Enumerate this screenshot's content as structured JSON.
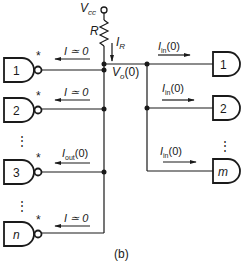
{
  "diagram": {
    "caption": "(b)",
    "supply": {
      "label": "V",
      "label_sub": "cc"
    },
    "resistor": {
      "label": "R"
    },
    "resistor_current": {
      "label": "I",
      "label_sub": "R"
    },
    "node_voltage": {
      "label": "V",
      "label_sub": "o",
      "label_suffix": "(0)"
    },
    "driver_gates": [
      {
        "id": "1",
        "star": "*",
        "current_label": "I ≃ 0"
      },
      {
        "id": "2",
        "star": "*",
        "current_label": "I ≃ 0"
      },
      {
        "id": "3",
        "star": "*",
        "current_label": "I",
        "current_sub": "out",
        "current_suffix": "(0)"
      },
      {
        "id": "n",
        "star": "*",
        "current_label": "I ≃ 0"
      }
    ],
    "load_gates": [
      {
        "id": "1",
        "current_label": "I",
        "current_sub": "in",
        "current_suffix": "(0)"
      },
      {
        "id": "2",
        "current_label": "I",
        "current_sub": "in",
        "current_suffix": "(0)"
      },
      {
        "id": "m",
        "current_label": "I",
        "current_sub": "in",
        "current_suffix": "(0)"
      }
    ],
    "ellipsis": "⋮"
  }
}
